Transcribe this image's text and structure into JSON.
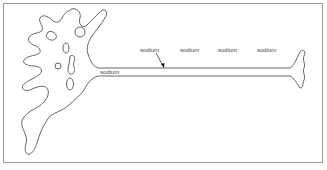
{
  "diagram": {
    "labels": {
      "sodium_1": "sodium",
      "sodium_2": "sodium",
      "sodium_3": "sodium",
      "sodium_4": "sodium",
      "sodium_inside": "sodium"
    },
    "colors": {
      "outline": "#555555",
      "frame": "#9a9a9a",
      "text": "#444444"
    }
  }
}
